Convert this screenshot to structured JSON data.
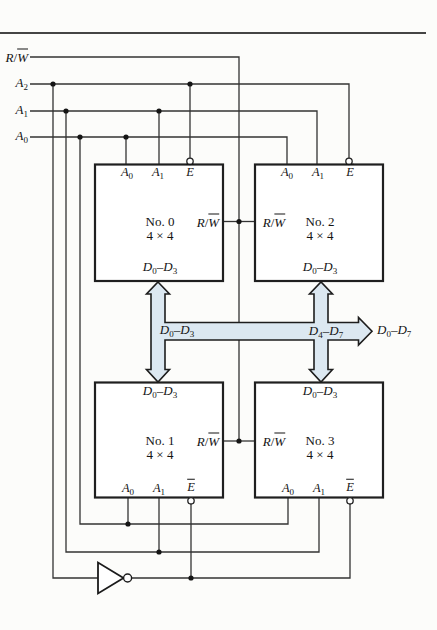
{
  "figure": {
    "kind": "memory expansion circuit diagram",
    "colors": {
      "bus_fill": "#dce8f1",
      "bus_outline": "#1d1d1d",
      "wire": "#333333",
      "chip_border": "#1f1f1f",
      "ink": "#141414",
      "top_rule": "#444444",
      "paper": "#fcfcfa"
    }
  },
  "signals": {
    "rw": [
      {
        "t": "R",
        "it": true
      },
      {
        "t": "/"
      },
      {
        "t": "W",
        "it": true,
        "ov": true
      }
    ],
    "a2": [
      {
        "t": "A",
        "it": true
      },
      {
        "t": "2",
        "sub": true
      }
    ],
    "a1": [
      {
        "t": "A",
        "it": true
      },
      {
        "t": "1",
        "sub": true
      }
    ],
    "a0": [
      {
        "t": "A",
        "it": true
      },
      {
        "t": "0",
        "sub": true
      }
    ],
    "e_bar": [
      {
        "t": "E",
        "it": true,
        "ov": true
      }
    ],
    "d0_d3": [
      {
        "t": "D",
        "it": true
      },
      {
        "t": "0",
        "sub": true
      },
      {
        "t": "–"
      },
      {
        "t": "D",
        "it": true
      },
      {
        "t": "3",
        "sub": true
      }
    ],
    "d4_d7": [
      {
        "t": "D",
        "it": true
      },
      {
        "t": "4",
        "sub": true
      },
      {
        "t": "–"
      },
      {
        "t": "D",
        "it": true
      },
      {
        "t": "7",
        "sub": true
      }
    ],
    "d0_d7": [
      {
        "t": "D",
        "it": true
      },
      {
        "t": "0",
        "sub": true
      },
      {
        "t": "–"
      },
      {
        "t": "D",
        "it": true
      },
      {
        "t": "7",
        "sub": true
      }
    ]
  },
  "chips": [
    {
      "name": "No. 0",
      "size": "4 × 4"
    },
    {
      "name": "No. 1",
      "size": "4 × 4"
    },
    {
      "name": "No. 2",
      "size": "4 × 4"
    },
    {
      "name": "No. 3",
      "size": "4 × 4"
    }
  ]
}
